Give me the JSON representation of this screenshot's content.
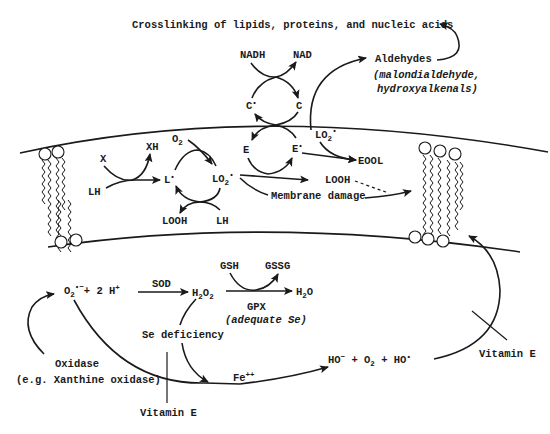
{
  "diagram": {
    "title_top": "Crosslinking of lipids, proteins, and nucleic acids",
    "aldehydes": {
      "label": "Aldehydes",
      "detail_line1": "(malondialdehyde,",
      "detail_line2": "hydroxyalkenals)"
    },
    "nadh_cycle": {
      "nadh": "NADH",
      "nad": "NAD",
      "c_radical": "C",
      "c": "C"
    },
    "membrane": {
      "x": "X",
      "xh": "XH",
      "lh_left": "LH",
      "l_radical": "L",
      "o2": "O",
      "lo2_radical": "LO",
      "looh_bottom": "LOOH",
      "lh_bottom": "LH",
      "e": "E",
      "e_radical": "E",
      "lo2_radical_right": "LO",
      "eool": "EOOL",
      "looh_right": "LOOH",
      "membrane_damage": "Membrane damage"
    },
    "ros": {
      "superoxide": "O",
      "plus_2h": "+ 2 H",
      "sod": "SOD",
      "h2o2": "H",
      "gsh": "GSH",
      "gssg": "GSSG",
      "gpx": "GPX",
      "adequate_se": "(adequate Se)",
      "h2o": "H",
      "se_deficiency": "Se deficiency",
      "oxidase": "Oxidase",
      "oxidase_example": "(e.g. Xanthine oxidase)",
      "fe": "Fe",
      "hydroxyl_products": "HO",
      "vitamin_e_bottom": "Vitamin E",
      "vitamin_e_right": "Vitamin E"
    }
  }
}
